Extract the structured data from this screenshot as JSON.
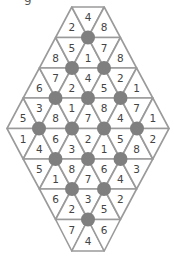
{
  "puzzle": {
    "corner_label": "g",
    "colors": {
      "line": "#9a9a9a",
      "dot": "#7f7f7f",
      "text": "#444444",
      "background": "#ffffff"
    },
    "geometry": {
      "center_x": 88,
      "half_width": 16.2,
      "row_y": [
        7,
        37.5,
        68,
        98,
        128.5,
        159,
        189,
        219.5,
        251
      ]
    },
    "rows": [
      [
        2,
        4,
        8
      ],
      [
        8,
        5,
        1,
        7,
        8
      ],
      [
        6,
        7,
        2,
        4,
        5,
        2,
        1
      ],
      [
        5,
        3,
        8,
        1,
        7,
        8,
        4,
        7,
        1
      ],
      [
        1,
        4,
        6,
        3,
        2,
        1,
        5,
        8,
        2
      ],
      [
        5,
        1,
        8,
        7,
        6,
        4,
        3
      ],
      [
        6,
        2,
        3,
        5,
        2
      ],
      [
        7,
        4,
        6
      ]
    ],
    "dots": [
      [
        88,
        37.5
      ],
      [
        72,
        68
      ],
      [
        104,
        68
      ],
      [
        55.5,
        98
      ],
      [
        88,
        98
      ],
      [
        120.5,
        98
      ],
      [
        39,
        128.5
      ],
      [
        72,
        128.5
      ],
      [
        104,
        128.5
      ],
      [
        137,
        128.5
      ],
      [
        55.5,
        159
      ],
      [
        88,
        159
      ],
      [
        120.5,
        159
      ],
      [
        72,
        189
      ],
      [
        104,
        189
      ],
      [
        88,
        219.5
      ]
    ],
    "dot_radius": 7
  }
}
